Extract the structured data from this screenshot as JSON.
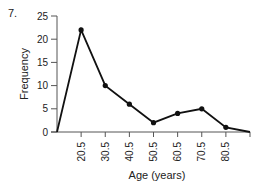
{
  "problem_number": "7.",
  "chart_data": {
    "type": "line",
    "title": "",
    "xlabel": "Age (years)",
    "ylabel": "Frequency",
    "x_tick_labels": [
      "20.5",
      "30.5",
      "40.5",
      "50.5",
      "60.5",
      "70.5",
      "80.5"
    ],
    "y_tick_labels": [
      "0",
      "5",
      "10",
      "15",
      "20",
      "25"
    ],
    "x": [
      10.5,
      20.5,
      30.5,
      40.5,
      50.5,
      60.5,
      70.5,
      80.5,
      90.5
    ],
    "values": [
      0,
      22,
      10,
      6,
      2,
      4,
      5,
      1,
      0
    ],
    "ylim": [
      0,
      25
    ],
    "xlim": [
      10.5,
      90.5
    ],
    "grid": false,
    "legend": null,
    "markers_on": [
      20.5,
      30.5,
      40.5,
      50.5,
      60.5,
      70.5,
      80.5
    ],
    "line_color": "#111111"
  }
}
